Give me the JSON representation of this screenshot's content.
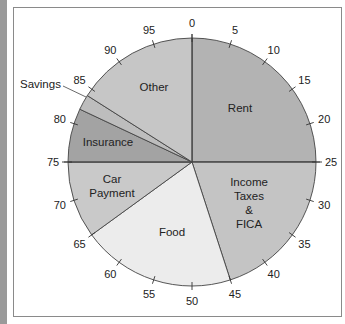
{
  "chart_data": {
    "type": "pie",
    "title": "",
    "scale": {
      "min": 0,
      "max": 100,
      "step": 5,
      "tick_labels": [
        "0",
        "5",
        "10",
        "15",
        "20",
        "25",
        "30",
        "35",
        "40",
        "45",
        "50",
        "55",
        "60",
        "65",
        "70",
        "75",
        "80",
        "85",
        "90",
        "95"
      ]
    },
    "slices": [
      {
        "label": "Rent",
        "start": 0,
        "end": 25,
        "value": 25,
        "color": "#b3b3b3"
      },
      {
        "label": "Income Taxes & FICA",
        "start": 25,
        "end": 45,
        "value": 20,
        "color": "#c4c4c4"
      },
      {
        "label": "Food",
        "start": 45,
        "end": 65,
        "value": 20,
        "color": "#ececec"
      },
      {
        "label": "Car Payment",
        "start": 65,
        "end": 75,
        "value": 10,
        "color": "#c9c9c9"
      },
      {
        "label": "Insurance",
        "start": 75,
        "end": 82,
        "value": 7,
        "color": "#a3a3a3"
      },
      {
        "label": "Savings",
        "start": 82,
        "end": 84,
        "value": 2,
        "color": "#bdbdbd"
      },
      {
        "label": "Other",
        "start": 84,
        "end": 100,
        "value": 16,
        "color": "#c6c6c6"
      }
    ]
  },
  "labels": {
    "rent": "Rent",
    "income_lines": [
      "Income",
      "Taxes",
      "&",
      "FICA"
    ],
    "food": "Food",
    "car_lines": [
      "Car",
      "Payment"
    ],
    "insurance": "Insurance",
    "savings": "Savings",
    "other": "Other"
  }
}
